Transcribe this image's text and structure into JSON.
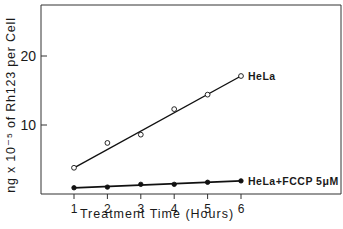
{
  "chart_data": {
    "type": "line",
    "title": "",
    "xlabel": "Treatment Time (Hours)",
    "ylabel": "ng x 10⁻⁵ of Rh123 per Cell",
    "x": [
      1,
      2,
      3,
      4,
      5,
      6
    ],
    "xticks": [
      "1",
      "2",
      "3",
      "4",
      "5",
      "6"
    ],
    "yticks": [
      "10",
      "20"
    ],
    "ytick_values": [
      10,
      20
    ],
    "xlim": [
      0,
      9
    ],
    "ylim": [
      0,
      27.3
    ],
    "grid": false,
    "legend_position": "inline labels at series ends (right)",
    "series": [
      {
        "name": "HeLa",
        "marker": "open-circle",
        "values": [
          3.8,
          7.4,
          8.6,
          12.3,
          14.4,
          17.1
        ],
        "fit_line": {
          "x0": 1,
          "y0": 3.8,
          "x1": 6,
          "y1": 17.1
        }
      },
      {
        "name": "HeLa+FCCP 5μM",
        "marker": "filled-circle",
        "values": [
          0.9,
          1.0,
          1.4,
          1.4,
          1.7,
          1.9
        ],
        "fit_line": {
          "x0": 1,
          "y0": 0.9,
          "x1": 6,
          "y1": 1.9
        }
      }
    ]
  },
  "labels": {
    "ylabel": "ng x 10⁻⁵ of Rh123 per Cell",
    "xlabel": "Treatment Time (Hours)",
    "series1": "HeLa",
    "series2": "HeLa+FCCP 5μM"
  }
}
